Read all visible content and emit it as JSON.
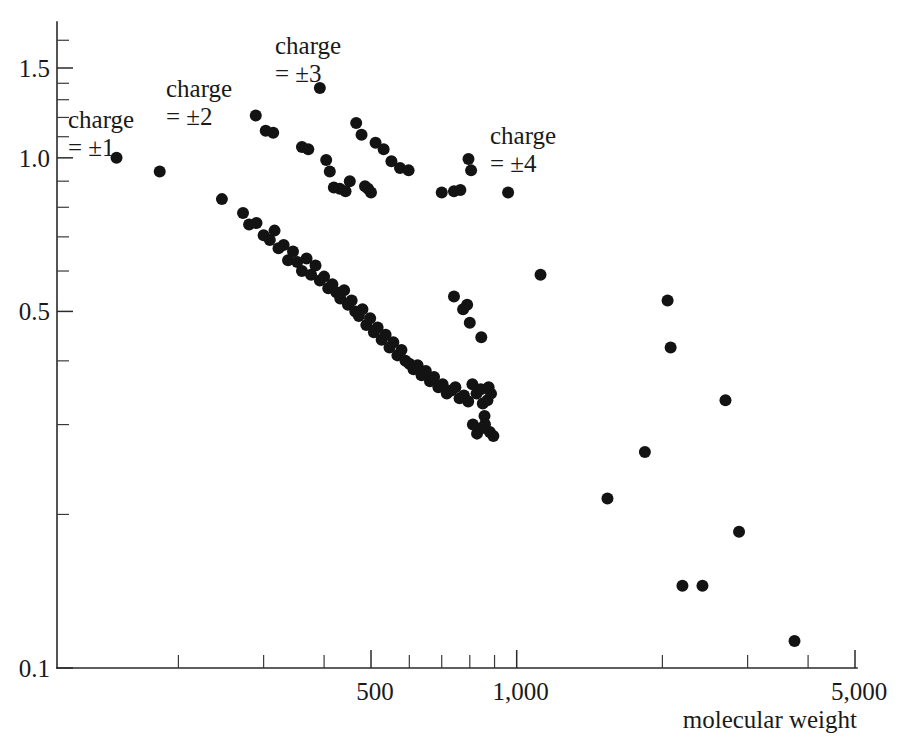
{
  "chart_data": {
    "type": "scatter",
    "title": "",
    "subtitle": "",
    "xlabel": "molecular weight",
    "ylabel": "",
    "xscale": "log",
    "yscale": "log",
    "xlim": [
      90,
      5000
    ],
    "ylim": [
      0.1,
      1.75
    ],
    "grid": false,
    "legend_position": "inline-annotations",
    "x_ticks_labeled": [
      "500",
      "1,000",
      "5,000"
    ],
    "x_tick_values": [
      500,
      1000,
      5000
    ],
    "x_minor_ticks": [
      200,
      300,
      400,
      600,
      700,
      800,
      900,
      2000,
      3000,
      4000
    ],
    "y_ticks_labeled": [
      "1.5",
      "1.0",
      "0.5",
      "0.1"
    ],
    "y_tick_values": [
      1.5,
      1.0,
      0.5,
      0.1
    ],
    "y_minor_ticks": [
      1.7,
      1.4,
      1.3,
      1.2,
      1.1,
      0.9,
      0.8,
      0.7,
      0.6,
      0.4,
      0.3,
      0.2
    ],
    "marker_color": "#131313",
    "marker_radius_px": 6,
    "annotations": [
      {
        "name": "charge-1",
        "line1": "charge",
        "line2": "= ±1",
        "x_px": 68,
        "y_px": 106
      },
      {
        "name": "charge-2",
        "line1": "charge",
        "line2": "= ±2",
        "x_px": 166,
        "y_px": 75
      },
      {
        "name": "charge-3",
        "line1": "charge",
        "line2": "= ±3",
        "x_px": 275,
        "y_px": 32
      },
      {
        "name": "charge-4",
        "line1": "charge",
        "line2": "= ±4",
        "x_px": 490,
        "y_px": 122
      }
    ],
    "series": [
      {
        "name": "charge = ±1",
        "points": [
          [
            149,
            1.0
          ],
          [
            183,
            0.94
          ]
        ]
      },
      {
        "name": "charge = ±2",
        "points": [
          [
            246,
            0.83
          ],
          [
            272,
            0.78
          ],
          [
            280,
            0.74
          ],
          [
            290,
            0.745
          ],
          [
            300,
            0.705
          ],
          [
            309,
            0.69
          ],
          [
            316,
            0.72
          ],
          [
            322,
            0.665
          ],
          [
            330,
            0.675
          ],
          [
            337,
            0.63
          ],
          [
            345,
            0.655
          ],
          [
            352,
            0.625
          ],
          [
            360,
            0.6
          ],
          [
            368,
            0.635
          ],
          [
            376,
            0.59
          ],
          [
            384,
            0.615
          ],
          [
            392,
            0.575
          ],
          [
            400,
            0.585
          ],
          [
            408,
            0.555
          ],
          [
            416,
            0.565
          ],
          [
            424,
            0.545
          ],
          [
            432,
            0.53
          ],
          [
            440,
            0.55
          ],
          [
            448,
            0.515
          ],
          [
            456,
            0.525
          ],
          [
            464,
            0.5
          ],
          [
            472,
            0.49
          ],
          [
            480,
            0.505
          ],
          [
            489,
            0.47
          ],
          [
            498,
            0.485
          ],
          [
            507,
            0.455
          ],
          [
            516,
            0.465
          ],
          [
            526,
            0.44
          ],
          [
            536,
            0.45
          ],
          [
            546,
            0.425
          ],
          [
            556,
            0.435
          ],
          [
            567,
            0.41
          ],
          [
            578,
            0.42
          ],
          [
            589,
            0.4
          ],
          [
            600,
            0.395
          ],
          [
            612,
            0.385
          ],
          [
            624,
            0.392
          ],
          [
            636,
            0.375
          ],
          [
            649,
            0.382
          ],
          [
            662,
            0.365
          ],
          [
            675,
            0.372
          ],
          [
            689,
            0.355
          ],
          [
            703,
            0.36
          ],
          [
            717,
            0.345
          ],
          [
            732,
            0.35
          ],
          [
            747,
            0.355
          ],
          [
            762,
            0.338
          ],
          [
            778,
            0.342
          ],
          [
            794,
            0.333
          ],
          [
            810,
            0.36
          ],
          [
            826,
            0.345
          ],
          [
            843,
            0.352
          ],
          [
            851,
            0.33
          ],
          [
            858,
            0.312
          ],
          [
            860,
            0.3
          ],
          [
            845,
            0.295
          ],
          [
            828,
            0.288
          ],
          [
            812,
            0.3
          ],
          [
            880,
            0.29
          ],
          [
            895,
            0.285
          ],
          [
            870,
            0.335
          ],
          [
            885,
            0.345
          ],
          [
            875,
            0.355
          ]
        ]
      },
      {
        "name": "charge = ±3",
        "points": [
          [
            289,
            1.21
          ],
          [
            303,
            1.13
          ],
          [
            314,
            1.12
          ],
          [
            360,
            1.05
          ],
          [
            371,
            1.04
          ],
          [
            392,
            1.37
          ],
          [
            404,
            0.99
          ],
          [
            411,
            0.94
          ],
          [
            419,
            0.875
          ],
          [
            431,
            0.87
          ],
          [
            443,
            0.86
          ],
          [
            452,
            0.9
          ],
          [
            466,
            1.17
          ],
          [
            478,
            1.11
          ],
          [
            486,
            0.88
          ],
          [
            493,
            0.87
          ],
          [
            500,
            0.855
          ],
          [
            511,
            1.07
          ],
          [
            531,
            1.04
          ],
          [
            551,
            0.985
          ],
          [
            574,
            0.955
          ],
          [
            598,
            0.945
          ]
        ]
      },
      {
        "name": "charge = ±4",
        "points": [
          [
            700,
            0.855
          ],
          [
            795,
            0.995
          ],
          [
            805,
            0.945
          ],
          [
            742,
            0.86
          ],
          [
            765,
            0.865
          ],
          [
            960,
            0.855
          ],
          [
            742,
            0.535
          ],
          [
            775,
            0.505
          ],
          [
            790,
            0.515
          ],
          [
            800,
            0.475
          ],
          [
            845,
            0.445
          ]
        ]
      },
      {
        "name": "high molecular weight (unlabeled)",
        "points": [
          [
            1120,
            0.59
          ],
          [
            1540,
            0.215
          ],
          [
            1840,
            0.265
          ],
          [
            2050,
            0.525
          ],
          [
            2080,
            0.425
          ],
          [
            2200,
            0.145
          ],
          [
            2420,
            0.145
          ],
          [
            2700,
            0.335
          ],
          [
            2880,
            0.185
          ],
          [
            3750,
            0.113
          ]
        ]
      }
    ]
  },
  "axes": {
    "x_label": "molecular weight",
    "y_tick_15": "1.5",
    "y_tick_10": "1.0",
    "y_tick_05": "0.5",
    "y_tick_01": "0.1",
    "x_tick_500": "500",
    "x_tick_1000": "1,000",
    "x_tick_5000": "5,000"
  }
}
